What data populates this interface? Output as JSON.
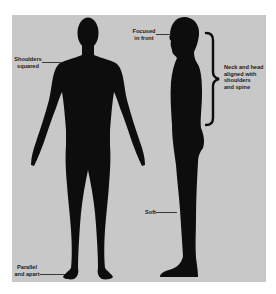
{
  "diagram": {
    "title": "",
    "figures": [
      {
        "id": "front-view",
        "description": "Front silhouette of standing figure"
      },
      {
        "id": "side-view",
        "description": "Side silhouette of standing figure"
      }
    ],
    "labels": {
      "shoulders": "Shoulders\nsquared",
      "eyes": "Focused\nin front",
      "neck": "Neck and head\naligned with\nshoulders\nand spine",
      "knees": "Soft",
      "feet": "Parallel\nand apart"
    },
    "colors": {
      "background": "#ffffff",
      "panel": "#c8c8c8",
      "silhouette": "#0d0d0d",
      "label_text": "#1a1a1a",
      "leader_line": "#3a3a3a"
    }
  }
}
